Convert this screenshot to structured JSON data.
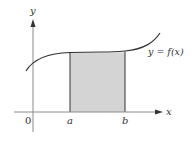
{
  "diagram": {
    "type": "area-under-curve",
    "axes": {
      "x_label": "x",
      "y_label": "y",
      "origin_label": "0"
    },
    "curve": {
      "label": "y = f(x)",
      "color": "#333333"
    },
    "interval": {
      "left_label": "a",
      "right_label": "b",
      "fill_color": "#d4d4d4",
      "edge_color": "#333333"
    },
    "colors": {
      "axis": "#8a8a8a",
      "background": "#ffffff"
    }
  }
}
